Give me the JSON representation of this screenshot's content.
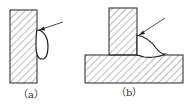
{
  "figure": {
    "panels": [
      {
        "id": "a",
        "label": "（a）",
        "description": "Vertical plate with teardrop weld bead on right face, arrow pointing to bead top"
      },
      {
        "id": "b",
        "label": "（b）",
        "description": "T-joint: vertical plate on horizontal base plate with fillet weld bead in corner, arrow pointing to bead top"
      }
    ],
    "colors": {
      "stroke": "#222222",
      "hatch": "#555555",
      "background": "#ffffff"
    }
  }
}
